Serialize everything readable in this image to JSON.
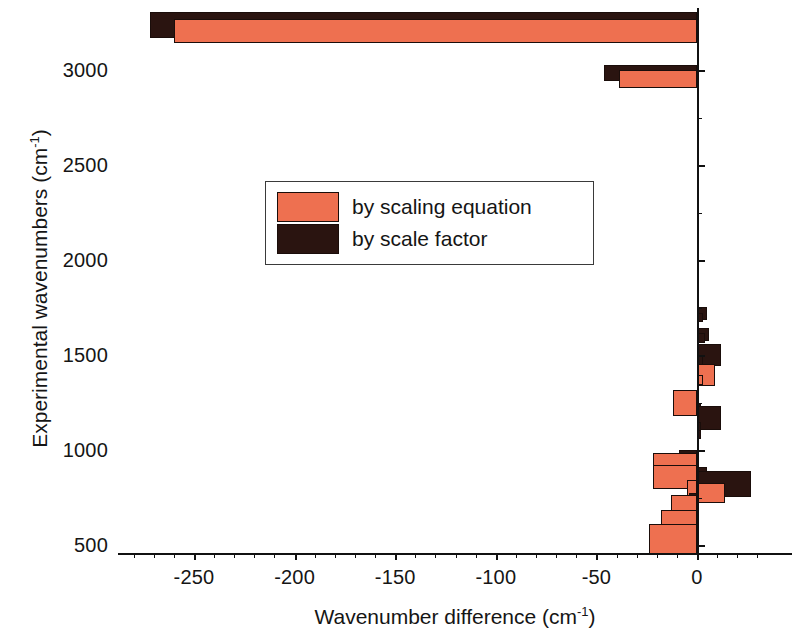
{
  "chart_data": {
    "type": "bar",
    "orientation": "horizontal",
    "title": "",
    "xlabel": "Wavenumber difference (cm-1)",
    "xlabel_base": "Wavenumber difference (cm",
    "xlabel_sup": "-1",
    "xlabel_tail": ")",
    "ylabel": "Experimental wavenumbers (cm-1)",
    "ylabel_base": "Experimental wavenumbers (cm",
    "ylabel_sup": "-1",
    "ylabel_tail": ")",
    "xlim": [
      -282,
      36
    ],
    "ylim": [
      468,
      3258
    ],
    "xticks": [
      -250,
      -200,
      -150,
      -100,
      -50,
      0
    ],
    "xticklabels": [
      "-250",
      "-200",
      "-150",
      "-100",
      "-50",
      "0"
    ],
    "xminorticks": [
      -280,
      -270,
      -260,
      -240,
      -230,
      -220,
      -210,
      -190,
      -180,
      -170,
      -160,
      -140,
      -130,
      -120,
      -110,
      -90,
      -80,
      -70,
      -60,
      -40,
      -30,
      -20,
      -10,
      10,
      20,
      30
    ],
    "yticks": [
      500,
      1000,
      1500,
      2000,
      2500,
      3000
    ],
    "yticklabels": [
      "500",
      "1000",
      "1500",
      "2000",
      "2500",
      "3000"
    ],
    "yminorticks": [
      750,
      1250,
      1750,
      2250,
      2750
    ],
    "grid": false,
    "legend_position": "upper-center-left",
    "colors": {
      "scaling_equation": "#ee7050",
      "scale_factor": "#2a1410",
      "axis": "#111111",
      "background": "#ffffff",
      "bar_outline": "#1a0d0a"
    },
    "categories": [
      "3215",
      "3160",
      "2975",
      "2940",
      "1700",
      "1620",
      "1500",
      "1465",
      "1390",
      "1300",
      "1240",
      "1190",
      "1130",
      "1060",
      "1000",
      "940",
      "880",
      "830",
      "800",
      "760",
      "700",
      "640",
      "580",
      "520"
    ],
    "series": [
      {
        "name": "by scaling equation",
        "color": "#ee7050",
        "values": [
          -258,
          -258,
          -38,
          -38,
          0,
          -1,
          1,
          -2,
          3,
          -11,
          2,
          0,
          -2,
          1,
          -1,
          -21,
          -21,
          -5,
          -4,
          7,
          -12,
          -17,
          -23,
          -23
        ]
      },
      {
        "name": "by scale factor",
        "color": "#2a1410",
        "values": [
          -270,
          -270,
          -45,
          -45,
          4,
          5,
          11,
          4,
          1,
          12,
          4,
          2,
          2,
          -8,
          -8,
          1,
          16,
          27,
          10,
          3,
          1,
          0,
          0,
          0
        ]
      }
    ],
    "legend": [
      {
        "label": "by scaling equation",
        "color": "#ee7050",
        "series_key": "scaling_equation"
      },
      {
        "label": "by scale factor",
        "color": "#2a1410",
        "series_key": "scale_factor"
      }
    ],
    "bars": [
      {
        "y": 3238,
        "h": 26,
        "v": -272,
        "s": "sf"
      },
      {
        "y": 3205,
        "h": 24,
        "v": -260,
        "s": "eq"
      },
      {
        "y": 2985,
        "h": 16,
        "v": -46,
        "s": "sf"
      },
      {
        "y": 2952,
        "h": 18,
        "v": -39,
        "s": "eq"
      },
      {
        "y": 1720,
        "h": 13,
        "v": 5,
        "s": "sf"
      },
      {
        "y": 1700,
        "h": 9,
        "v": 3,
        "s": "sf"
      },
      {
        "y": 1610,
        "h": 13,
        "v": 6,
        "s": "sf"
      },
      {
        "y": 1590,
        "h": 10,
        "v": 4,
        "s": "sf"
      },
      {
        "y": 1500,
        "h": 22,
        "v": 12,
        "s": "sf"
      },
      {
        "y": 1470,
        "h": 10,
        "v": 3,
        "s": "sf"
      },
      {
        "y": 1395,
        "h": 22,
        "v": 9,
        "s": "eq"
      },
      {
        "y": 1368,
        "h": 10,
        "v": 3,
        "s": "eq"
      },
      {
        "y": 1250,
        "h": 26,
        "v": -12,
        "s": "eq"
      },
      {
        "y": 1215,
        "h": 10,
        "v": 2,
        "s": "sf"
      },
      {
        "y": 1170,
        "h": 24,
        "v": 12,
        "s": "sf"
      },
      {
        "y": 1120,
        "h": 11,
        "v": 2,
        "s": "sf"
      },
      {
        "y": 1080,
        "h": 9,
        "v": 2,
        "s": "sf"
      },
      {
        "y": 950,
        "h": 20,
        "v": -9,
        "s": "sf"
      },
      {
        "y": 905,
        "h": 30,
        "v": -22,
        "s": "eq"
      },
      {
        "y": 860,
        "h": 24,
        "v": -22,
        "s": "eq"
      },
      {
        "y": 855,
        "h": 22,
        "v": 5,
        "s": "sf"
      },
      {
        "y": 820,
        "h": 26,
        "v": 27,
        "s": "sf"
      },
      {
        "y": 785,
        "h": 22,
        "v": -5,
        "s": "eq"
      },
      {
        "y": 775,
        "h": 20,
        "v": 14,
        "s": "eq"
      },
      {
        "y": 740,
        "h": 12,
        "v": -4,
        "s": "sf"
      },
      {
        "y": 700,
        "h": 24,
        "v": -13,
        "s": "eq"
      },
      {
        "y": 620,
        "h": 24,
        "v": -18,
        "s": "eq"
      },
      {
        "y": 530,
        "h": 30,
        "v": -24,
        "s": "eq"
      }
    ]
  }
}
